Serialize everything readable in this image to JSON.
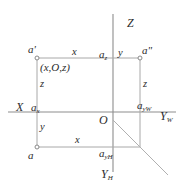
{
  "figure": {
    "background_color": "#ffffff",
    "line_color": "#a8a8a8",
    "axis_color": "#8d8d8d",
    "text_color": "#2b2b2b",
    "width": 184,
    "height": 193
  },
  "axes": {
    "z": "Z",
    "x": "X",
    "y_w": "Y",
    "y_w_sub": "W",
    "y_h": "Y",
    "y_h_sub": "H",
    "origin": "O"
  },
  "points": {
    "a_front": "a",
    "a_front_prime": "'",
    "a_side": "a",
    "a_side_prime": "\"",
    "a_top": "a",
    "a_x": "a",
    "a_x_sub": "x",
    "a_z": "a",
    "a_z_sub": "z",
    "a_yw": "a",
    "a_yw_sub": "yW",
    "a_yh": "a",
    "a_yh_sub": "yH"
  },
  "edges": {
    "top_x": "x",
    "bottom_x": "x",
    "left_z": "z",
    "right_z": "z",
    "left_y": "y",
    "top_y": "y"
  },
  "coordinate_label": "(x,O,z)"
}
